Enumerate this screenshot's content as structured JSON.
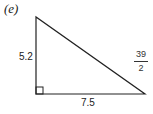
{
  "part_label": "(e)",
  "triangle": {
    "type": "right triangle",
    "right_angle_vertex": "bottom-left",
    "vertical_leg": "5.2",
    "horizontal_leg": "7.5",
    "hypotenuse": {
      "numerator": "39",
      "denominator": "2"
    }
  }
}
